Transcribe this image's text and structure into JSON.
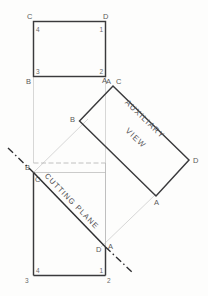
{
  "drawing": {
    "title": "Auxiliary view with cutting plane",
    "background_color": "#fdfdfc",
    "line_color": "#3a3a3c",
    "projection_line_color": "#c6c6c6"
  },
  "top_view": {
    "name": "top-rectangle",
    "corner_letters": {
      "top_left": "C",
      "top_right": "D",
      "bottom_left": "B",
      "bottom_right": "A"
    },
    "corner_numbers": {
      "top_left": "4",
      "top_right": "1",
      "bottom_left": "3",
      "bottom_right": "2"
    }
  },
  "auxiliary_view": {
    "name": "auxiliary-rectangle",
    "label_line1": "AUXILIARY",
    "label_line2": "VIEW",
    "corner_letters": {
      "top": "C",
      "left": "B",
      "right": "D",
      "bottom": "A"
    },
    "projected_top": "A"
  },
  "front_view": {
    "name": "front-rectangle",
    "corner_letters": {
      "top_left": "B",
      "inner_top_left": "C",
      "right": "D",
      "right_outer": "A"
    },
    "corner_numbers": {
      "bottom_left_outer": "3",
      "bottom_left_inner": "4",
      "bottom_right_inner": "1",
      "bottom_right_outer": "2"
    }
  },
  "cutting_plane": {
    "name": "cutting-plane-line",
    "label": "CUTTING PLANE"
  }
}
